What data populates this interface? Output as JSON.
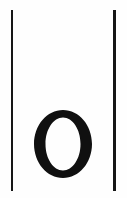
{
  "page": {
    "width": 127,
    "height": 198,
    "background_color": "#fefefe",
    "ink_color": "#101010"
  },
  "rules": {
    "color": "#161616",
    "stroke_width": 2.6,
    "top": 10,
    "bottom": 191,
    "left_rule": {
      "name": "left-column-rule",
      "x": 10.6
    },
    "right_rule": {
      "name": "right-column-rule",
      "x": 113.4
    }
  },
  "letter": {
    "character": "O",
    "style": "serif-capital",
    "color": "#101010",
    "bounds": {
      "x": 34,
      "y": 110,
      "width": 58,
      "height": 68
    },
    "outer_rx": 29,
    "outer_ry": 34,
    "inner_rx": 17.5,
    "inner_ry": 26.5,
    "center_x": 63,
    "center_y": 144
  }
}
